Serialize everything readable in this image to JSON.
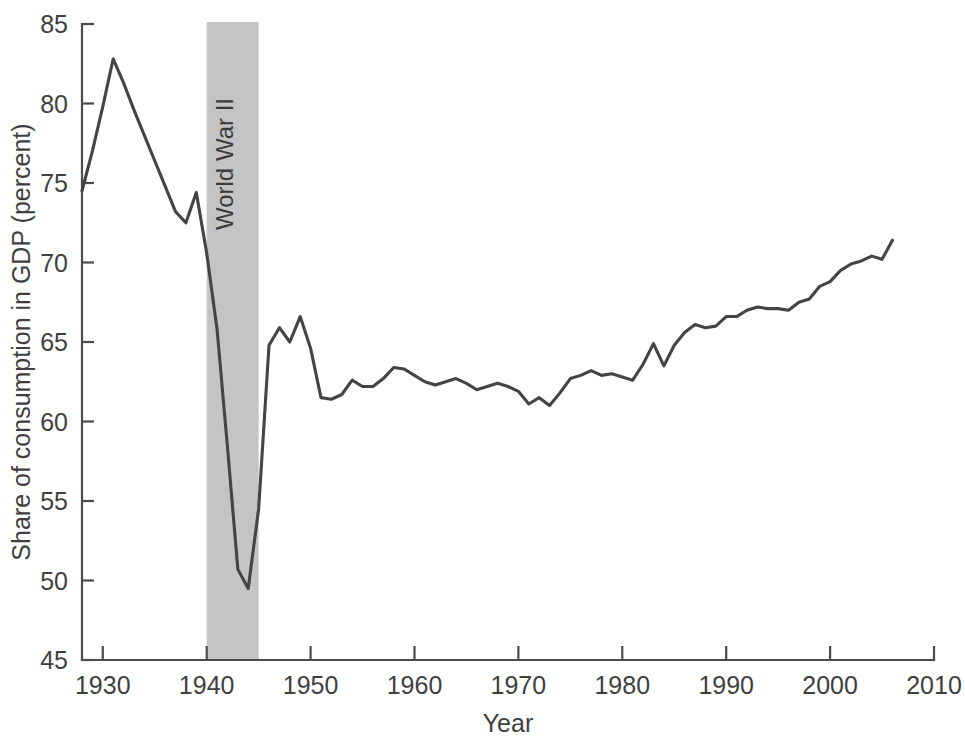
{
  "chart_data": {
    "type": "line",
    "title": "",
    "xlabel": "Year",
    "ylabel": "Share of consumption in GDP (percent)",
    "xlim": [
      1928,
      2010
    ],
    "ylim": [
      45,
      85
    ],
    "xticks": [
      1930,
      1940,
      1950,
      1960,
      1970,
      1980,
      1990,
      2000,
      2010
    ],
    "xtick_labels": [
      "1930",
      "1940",
      "1950",
      "1960",
      "1970",
      "1980",
      "1990",
      "2000",
      "2010"
    ],
    "yticks": [
      45,
      50,
      55,
      60,
      65,
      70,
      75,
      80,
      85
    ],
    "ytick_labels": [
      "45",
      "50",
      "55",
      "60",
      "65",
      "70",
      "75",
      "80",
      "85"
    ],
    "grid": false,
    "legend": false,
    "line_color": "#444444",
    "axis_color": "#4b4b4b",
    "annotations": [
      {
        "label": "World War II",
        "type": "vertical-band",
        "x_start": 1940,
        "x_end": 1945,
        "fill_color": "#c4c4c4",
        "label_rotation": -90
      }
    ],
    "x": [
      1928,
      1929,
      1930,
      1931,
      1932,
      1933,
      1934,
      1935,
      1936,
      1937,
      1938,
      1939,
      1940,
      1941,
      1942,
      1943,
      1944,
      1945,
      1946,
      1947,
      1948,
      1949,
      1950,
      1951,
      1952,
      1953,
      1954,
      1955,
      1956,
      1957,
      1958,
      1959,
      1960,
      1961,
      1962,
      1963,
      1964,
      1965,
      1966,
      1967,
      1968,
      1969,
      1970,
      1971,
      1972,
      1973,
      1974,
      1975,
      1976,
      1977,
      1978,
      1979,
      1980,
      1981,
      1982,
      1983,
      1984,
      1985,
      1986,
      1987,
      1988,
      1989,
      1990,
      1991,
      1992,
      1993,
      1994,
      1995,
      1996,
      1997,
      1998,
      1999,
      2000,
      2001,
      2002,
      2003,
      2004,
      2005,
      2006
    ],
    "values": [
      74.5,
      77.0,
      79.8,
      82.8,
      81.3,
      79.6,
      78.0,
      76.4,
      74.8,
      73.2,
      72.5,
      74.4,
      70.6,
      65.8,
      58.4,
      50.7,
      49.5,
      54.5,
      64.8,
      65.9,
      65.0,
      66.6,
      64.6,
      61.5,
      61.4,
      61.7,
      62.6,
      62.2,
      62.2,
      62.7,
      63.4,
      63.3,
      62.9,
      62.5,
      62.3,
      62.5,
      62.7,
      62.4,
      62.0,
      62.2,
      62.4,
      62.2,
      61.9,
      61.1,
      61.5,
      61.0,
      61.8,
      62.7,
      62.9,
      63.2,
      62.9,
      63.0,
      62.8,
      62.6,
      63.6,
      64.9,
      63.5,
      64.8,
      65.6,
      66.1,
      65.9,
      66.0,
      66.6,
      66.6,
      67.0,
      67.2,
      67.1,
      67.1,
      67.0,
      67.5,
      67.7,
      68.5,
      68.8,
      69.5,
      69.9,
      70.1,
      70.4,
      70.2,
      71.4
    ]
  },
  "figure": {
    "plot_left_px": 82,
    "plot_right_px": 934,
    "plot_top_px": 24,
    "plot_bottom_px": 660
  }
}
